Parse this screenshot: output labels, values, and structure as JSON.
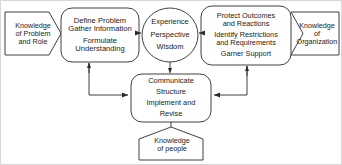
{
  "diagram": {
    "style": {
      "stroke": "#2b2b2b",
      "fill": "#ffffff",
      "text": "#1a1a1a",
      "border": "#d8d8d8"
    },
    "nodes": {
      "knowledge_problem": {
        "name": "knowledge-of-problem-and-role",
        "shape": "pentagon-right",
        "lines": [
          "Knowledge",
          "of Problem",
          "and Role"
        ]
      },
      "define_problem": {
        "name": "define-problem",
        "shape": "rounded-rect",
        "lines": [
          "Define Problem",
          "Gather Information",
          "Formulate",
          "Understanding"
        ]
      },
      "experience": {
        "name": "experience-perspective-wisdom",
        "shape": "ellipse",
        "lines": [
          "Experience",
          "Perspective",
          "Wisdom"
        ]
      },
      "protect_outcomes": {
        "name": "protect-outcomes",
        "shape": "rounded-rect",
        "lines": [
          "Protect Outcomes",
          "and Reactions",
          "Identify Restrictions",
          "and Requirements",
          "Garner Support"
        ]
      },
      "knowledge_organization": {
        "name": "knowledge-of-organization",
        "shape": "pentagon-left",
        "lines": [
          "Knowledge",
          "of",
          "Organization"
        ]
      },
      "communicate": {
        "name": "communicate-structure-implement",
        "shape": "rounded-rect",
        "lines": [
          "Communicate",
          "Structure",
          "Implement and",
          "Revise"
        ]
      },
      "knowledge_people": {
        "name": "knowledge-of-people",
        "shape": "pentagon-up",
        "lines": [
          "Knowledge",
          "of people"
        ]
      }
    },
    "edges": [
      {
        "from": "knowledge_problem",
        "to": "define_problem",
        "kind": "butt"
      },
      {
        "from": "define_problem",
        "to": "experience",
        "kind": "arrow-right"
      },
      {
        "from": "protect_outcomes",
        "to": "experience",
        "kind": "arrow-left"
      },
      {
        "from": "knowledge_organization",
        "to": "protect_outcomes",
        "kind": "butt"
      },
      {
        "from": "experience",
        "to": "communicate",
        "kind": "arrow-down"
      },
      {
        "from": "communicate",
        "to": "define_problem",
        "kind": "elbow-arrow-up-left"
      },
      {
        "from": "define_problem",
        "to": "communicate",
        "kind": "elbow-arrow-down-right"
      },
      {
        "from": "communicate",
        "to": "protect_outcomes",
        "kind": "elbow-arrow-up-right"
      },
      {
        "from": "protect_outcomes",
        "to": "communicate",
        "kind": "elbow-arrow-down-left"
      },
      {
        "from": "knowledge_people",
        "to": "communicate",
        "kind": "butt"
      }
    ]
  }
}
